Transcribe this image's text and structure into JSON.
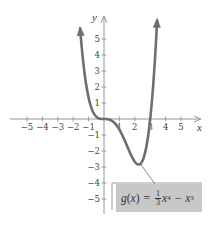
{
  "chart_data": {
    "type": "line",
    "title": "",
    "xlabel": "x",
    "ylabel": "y",
    "xlim": [
      -5.5,
      5.8
    ],
    "ylim": [
      -6.2,
      6.5
    ],
    "grid": false,
    "x_ticks": [
      "-5",
      "-4",
      "-3",
      "-2",
      "-1",
      "1",
      "2",
      "3",
      "4",
      "5"
    ],
    "y_ticks": [
      "5",
      "4",
      "3",
      "2",
      "1",
      "-1",
      "-2",
      "-3",
      "-4",
      "-5"
    ],
    "series": [
      {
        "name": "g(x) = (1/3)x^4 - x^3",
        "function": "g(x) = 1/3 x^4 - x^3",
        "color": "#6e6e6e",
        "x": [
          -1.55,
          -1.25,
          -1.0,
          -0.75,
          -0.5,
          -0.25,
          0,
          0.5,
          1.0,
          1.5,
          2.0,
          2.25,
          2.5,
          2.75,
          3.0,
          3.25,
          3.45
        ],
        "y": [
          5.65,
          3.26,
          1.33,
          0.53,
          0.15,
          0.02,
          0,
          -0.1,
          -0.67,
          -1.69,
          -2.67,
          -2.85,
          -2.6,
          -1.77,
          0,
          2.99,
          6.26
        ],
        "arrows": "both ends"
      }
    ],
    "annotations": [
      {
        "text": "g(x) = 1/3 x^4 - x^3",
        "points_to": [
          2.25,
          -2.85
        ],
        "style": "gray label box"
      }
    ],
    "key_points": {
      "minimum": [
        2.25,
        -2.85
      ],
      "x_intercepts": [
        0,
        3
      ],
      "inflection_points": [
        0,
        1.5
      ]
    }
  },
  "labels": {
    "x_axis": "x",
    "y_axis": "y",
    "callout": {
      "fn": "g",
      "var": "x",
      "equals": "=",
      "frac_num": "1",
      "frac_den": "3",
      "x1": "x",
      "exp1": "4",
      "minus": "−",
      "x2": "x",
      "exp2": "3"
    }
  }
}
